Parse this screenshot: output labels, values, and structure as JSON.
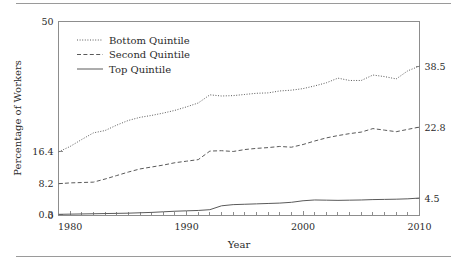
{
  "figure": {
    "background": "#ffffff",
    "frame_color": "#8d8d8d",
    "line_color": "#5a5a5a",
    "rule_color": "#9a9a9a"
  },
  "chart_data": {
    "type": "line",
    "title": "",
    "xlabel": "Year",
    "ylabel": "Percentage of Workers",
    "xlim": [
      1979,
      2010
    ],
    "ylim": [
      0,
      50
    ],
    "grid": false,
    "legend_position": "top-left",
    "x_ticklabels": [
      "1980",
      "1990",
      "2000",
      "2010"
    ],
    "x_tickvalues": [
      1980,
      1990,
      2000,
      2010
    ],
    "x_minor_tick_step": 1,
    "y_left_ticklabels": [
      "50",
      "16.4",
      "8.2",
      "0.3",
      "0"
    ],
    "y_left_tickvalues": [
      50,
      16.4,
      8.2,
      0.3,
      0
    ],
    "y_right_ticklabels": [
      "38.5",
      "22.8",
      "4.5"
    ],
    "y_right_tickvalues": [
      38.5,
      22.8,
      4.5
    ],
    "x": [
      1979,
      1980,
      1981,
      1982,
      1983,
      1984,
      1985,
      1986,
      1987,
      1988,
      1989,
      1990,
      1991,
      1992,
      1993,
      1994,
      1995,
      1996,
      1997,
      1998,
      1999,
      2000,
      2001,
      2002,
      2003,
      2004,
      2005,
      2006,
      2007,
      2008,
      2009,
      2010
    ],
    "series": [
      {
        "name": "Bottom Quintile",
        "style": "dotted",
        "values": [
          16.4,
          17.8,
          19.6,
          21.3,
          21.9,
          23.3,
          24.5,
          25.3,
          25.8,
          26.4,
          27.1,
          28.0,
          29.0,
          31.1,
          30.8,
          30.9,
          31.2,
          31.5,
          31.6,
          32.1,
          32.3,
          32.7,
          33.4,
          34.2,
          35.4,
          34.8,
          34.8,
          36.2,
          35.8,
          35.2,
          37.3,
          38.5
        ]
      },
      {
        "name": "Second Quintile",
        "style": "dashed",
        "values": [
          8.2,
          8.4,
          8.5,
          8.6,
          9.4,
          10.3,
          11.2,
          12.0,
          12.5,
          13.0,
          13.6,
          14.0,
          14.4,
          16.6,
          16.7,
          16.5,
          17.0,
          17.3,
          17.5,
          17.8,
          17.6,
          18.3,
          19.2,
          20.0,
          20.6,
          21.1,
          21.5,
          22.4,
          22.0,
          21.6,
          22.2,
          22.8
        ]
      },
      {
        "name": "Top Quintile",
        "style": "solid",
        "values": [
          0.3,
          0.35,
          0.4,
          0.45,
          0.5,
          0.55,
          0.6,
          0.7,
          0.8,
          0.95,
          1.1,
          1.2,
          1.3,
          1.5,
          2.5,
          2.8,
          2.9,
          3.0,
          3.1,
          3.2,
          3.4,
          3.8,
          4.0,
          3.95,
          3.9,
          3.95,
          4.0,
          4.1,
          4.15,
          4.2,
          4.3,
          4.5
        ]
      }
    ]
  },
  "legend": {
    "items": [
      {
        "label": "Bottom Quintile",
        "style": "dotted"
      },
      {
        "label": "Second Quintile",
        "style": "dashed"
      },
      {
        "label": "Top Quintile",
        "style": "solid"
      }
    ]
  }
}
